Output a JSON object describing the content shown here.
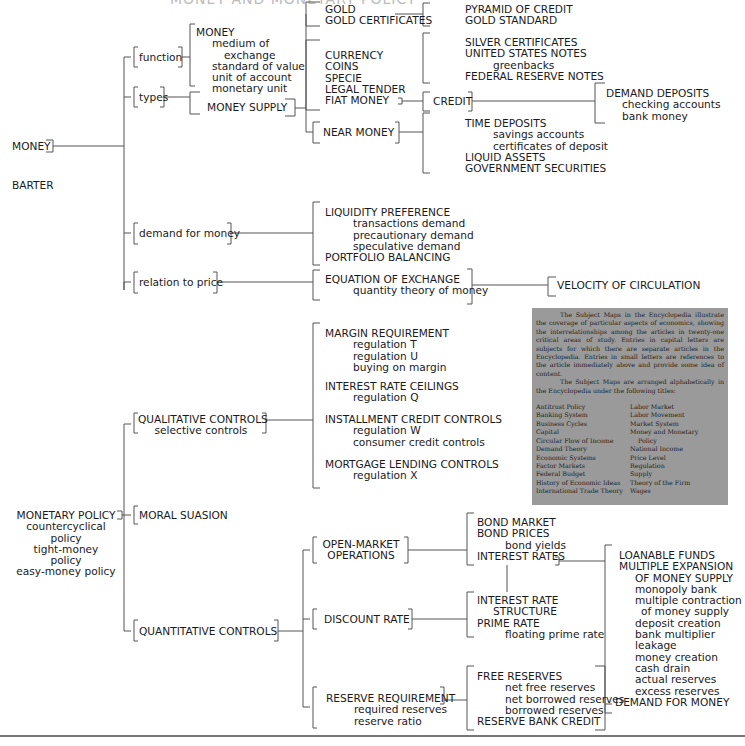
{
  "title": "MONEY AND MONETARY POLICY",
  "colors": {
    "line": "#555555",
    "infobox_bg": "#9a9a9a",
    "text": "#1a1a1a"
  },
  "money_map": {
    "root": "MONEY",
    "sibling": "BARTER",
    "branches": {
      "function": {
        "label": "function",
        "children": [
          "MONEY",
          "medium of",
          "exchange",
          "standard of value",
          "unit of account",
          "monetary unit"
        ]
      },
      "types": {
        "label": "types",
        "money_supply": "MONEY SUPPLY",
        "gold_group": [
          "GOLD",
          "GOLD CERTIFICATES"
        ],
        "gold_related": [
          "PYRAMID OF CREDIT",
          "GOLD STANDARD"
        ],
        "currency_group": [
          "CURRENCY",
          "COINS",
          "SPECIE",
          "LEGAL TENDER",
          "FIAT MONEY"
        ],
        "notes_group": [
          "SILVER CERTIFICATES",
          "UNITED STATES NOTES",
          "greenbacks",
          "FEDERAL RESERVE NOTES"
        ],
        "credit": "CREDIT",
        "demand_deposits": [
          "DEMAND DEPOSITS",
          "checking accounts",
          "bank money"
        ],
        "near_money": "NEAR MONEY",
        "near_money_children": [
          "TIME DEPOSITS",
          "savings accounts",
          "certificates of deposit",
          "LIQUID ASSETS",
          "GOVERNMENT SECURITIES"
        ]
      },
      "demand": {
        "label": "demand for money",
        "children": [
          "LIQUIDITY PREFERENCE",
          "transactions demand",
          "precautionary demand",
          "speculative demand",
          "PORTFOLIO BALANCING"
        ]
      },
      "price": {
        "label": "relation to price",
        "children": [
          "EQUATION OF EXCHANGE",
          "quantity theory of money"
        ],
        "velocity": "VELOCITY OF CIRCULATION"
      }
    }
  },
  "policy_map": {
    "root": [
      "MONETARY POLICY",
      "countercyclical",
      "policy",
      "tight-money",
      "policy",
      "easy-money policy"
    ],
    "qualitative": {
      "label": [
        "QUALITATIVE CONTROLS",
        "selective controls"
      ],
      "margin": [
        "MARGIN REQUIREMENT",
        "regulation T",
        "regulation U",
        "buying on margin"
      ],
      "ceilings": [
        "INTEREST RATE CEILINGS",
        "regulation Q"
      ],
      "installment": [
        "INSTALLMENT CREDIT CONTROLS",
        "regulation W",
        "consumer credit controls"
      ],
      "mortgage": [
        "MORTGAGE LENDING CONTROLS",
        "regulation X"
      ]
    },
    "moral_suasion": "MORAL SUASION",
    "quantitative": {
      "label": "QUANTITATIVE CONTROLS",
      "open_market": [
        "OPEN-MARKET",
        "OPERATIONS"
      ],
      "bonds": [
        "BOND MARKET",
        "BOND PRICES",
        "bond yields",
        "INTEREST RATES"
      ],
      "discount": "DISCOUNT RATE",
      "rate_structure": [
        "INTEREST RATE",
        "STRUCTURE",
        "PRIME RATE",
        "floating prime rate"
      ],
      "reserve": [
        "RESERVE REQUIREMENT",
        "required reserves",
        "reserve ratio"
      ],
      "free_reserves": [
        "FREE RESERVES",
        "net free reserves",
        "net borrowed reserves",
        "borrowed reserves",
        "RESERVE BANK CREDIT"
      ],
      "loanable": [
        "LOANABLE FUNDS",
        "MULTIPLE EXPANSION",
        "OF MONEY SUPPLY",
        "monopoly bank",
        "multiple contraction",
        "of money supply",
        "deposit creation",
        "bank multiplier",
        "leakage",
        "money creation",
        "cash drain",
        "actual reserves",
        "excess reserves",
        "DEMAND FOR MONEY"
      ]
    }
  },
  "infobox": {
    "paragraph1": "The Subject Maps in the Encyclopedia illustrate the coverage of particular aspects of economics, showing the interrelationships among the articles in twenty-one critical areas of study. Entries in capital letters are subjects for which there are separate articles in the Encyclopedia. Entries in small letters are references to the article immediately above and provide some idea of content.",
    "paragraph2": "The Subject Maps are arranged alphabetically in the Encyclopedia under the following titles:",
    "titles_left": [
      "Antitrust Policy",
      "Banking System",
      "Business Cycles",
      "Capital",
      "Circular Flow of Income",
      "Demand Theory",
      "Economic Systems",
      "Factor Markets",
      "Federal Budget",
      "History of Economic Ideas",
      "International Trade Theory"
    ],
    "titles_right": [
      "Labor Market",
      "Labor Movement",
      "Market System",
      "Money and Monetary",
      "Policy",
      "National Income",
      "Price Level",
      "Regulation",
      "Supply",
      "Theory of the Firm",
      "Wages"
    ]
  }
}
